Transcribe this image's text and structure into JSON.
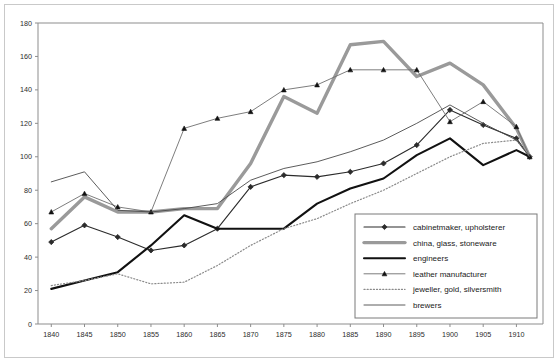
{
  "chart_data": {
    "type": "line",
    "title": "",
    "xlabel": "",
    "ylabel": "",
    "xlim": [
      1838,
      1914
    ],
    "ylim": [
      0,
      180
    ],
    "ytick_step": 20,
    "grid": false,
    "legend_position": "bottom-right",
    "x": [
      1840,
      1845,
      1850,
      1855,
      1860,
      1865,
      1870,
      1875,
      1880,
      1885,
      1890,
      1895,
      1900,
      1905,
      1910,
      1912
    ],
    "xticks": [
      "1840",
      "1845",
      "1850",
      "1855",
      "1860",
      "1865",
      "1870",
      "1875",
      "1880",
      "1885",
      "1890",
      "1895",
      "1900",
      "1905",
      "1910"
    ],
    "yticks": [
      "0",
      "20",
      "40",
      "60",
      "80",
      "100",
      "120",
      "140",
      "160",
      "180"
    ],
    "series": [
      {
        "name": "cabinetmaker, upholsterer",
        "color": "#2b2b2b",
        "width": 1.1,
        "marker": "diamond",
        "dash": "none",
        "values": [
          49,
          59,
          52,
          44,
          47,
          57,
          82,
          89,
          88,
          91,
          96,
          107,
          128,
          119,
          111,
          100
        ]
      },
      {
        "name": "china, glass, stoneware",
        "color": "#9a9a9a",
        "width": 3.4,
        "marker": "none",
        "dash": "none",
        "values": [
          57,
          76,
          67,
          67,
          69,
          69,
          96,
          136,
          126,
          167,
          169,
          148,
          156,
          143,
          117,
          100
        ]
      },
      {
        "name": "engineers",
        "color": "#111111",
        "width": 2.1,
        "marker": "none",
        "dash": "none",
        "values": [
          21,
          26,
          31,
          47,
          65,
          57,
          57,
          57,
          72,
          81,
          87,
          101,
          111,
          95,
          104,
          100
        ]
      },
      {
        "name": "leather manufacturer",
        "color": "#6e6e6e",
        "width": 0.9,
        "marker": "triangle",
        "dash": "none",
        "values": [
          67,
          78,
          70,
          67,
          117,
          123,
          127,
          140,
          143,
          152,
          152,
          152,
          121,
          133,
          118,
          100
        ]
      },
      {
        "name": "jeweller, gold, silversmith",
        "color": "#8a8a8a",
        "width": 1.2,
        "marker": "none",
        "dash": "dotted",
        "values": [
          23,
          26,
          30,
          24,
          25,
          35,
          47,
          57,
          63,
          72,
          80,
          90,
          100,
          108,
          110,
          100
        ]
      },
      {
        "name": "brewers",
        "color": "#4a4a4a",
        "width": 0.9,
        "marker": "none",
        "dash": "none",
        "values": [
          85,
          91,
          68,
          67,
          69,
          72,
          86,
          93,
          97,
          103,
          110,
          120,
          131,
          120,
          110,
          100
        ]
      }
    ]
  }
}
